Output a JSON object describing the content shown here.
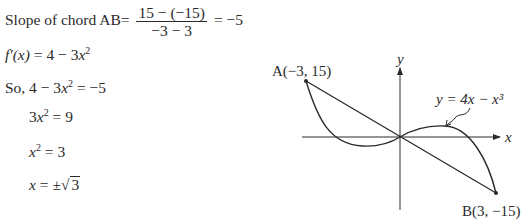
{
  "solution": {
    "slope_label": "Slope of chord AB=",
    "slope_numerator": "15 − (−15)",
    "slope_denominator": "−3 − 3",
    "slope_result": "= −5",
    "derivative_lhs": "f′(x)",
    "derivative_rhs_a": " = 4 − 3",
    "derivative_var": "x",
    "derivative_exp": "2",
    "so_prefix": "So, 4 − 3",
    "so_var": "x",
    "so_exp": "2",
    "so_rhs": " = −5",
    "step1_coef": "3",
    "step1_var": "x",
    "step1_exp": "2",
    "step1_rhs": " = 9",
    "step2_var": "x",
    "step2_exp": "2",
    "step2_rhs": " = 3",
    "step3_var": "x",
    "step3_mid": " = ±",
    "step3_sqrt": "3"
  },
  "graph": {
    "point_a_label": "A(−3, 15)",
    "point_b_label": "B(3, −15)",
    "curve_label": "y = 4x − x³",
    "x_axis_label": "x",
    "y_axis_label": "y",
    "colors": {
      "ink": "#2a2a2a",
      "background": "#ffffff"
    }
  }
}
